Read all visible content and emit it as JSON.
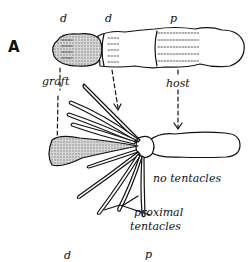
{
  "panel": {
    "label": "A"
  },
  "top_labels": {
    "d1": "d",
    "d2": "d",
    "p": "p"
  },
  "arrow_labels": {
    "graft": "graft",
    "host": "host"
  },
  "annotations": {
    "no_tentacles": "no tentacles",
    "proximal_line1": "proximal",
    "proximal_line2": "tentacles"
  },
  "bottom_labels": {
    "d": "d",
    "p": "p"
  },
  "colors": {
    "ink": "#111111",
    "graft_fill": "#c8c8c8",
    "background": "#ffffff"
  }
}
